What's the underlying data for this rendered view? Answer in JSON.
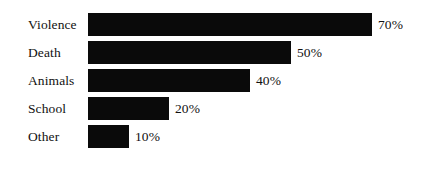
{
  "chart_data": {
    "type": "bar",
    "orientation": "horizontal",
    "title": "",
    "subtitle": "",
    "xlabel": "",
    "ylabel": "",
    "categories": [
      "Violence",
      "Death",
      "Animals",
      "School",
      "Other"
    ],
    "values": [
      70,
      50,
      40,
      20,
      10
    ],
    "value_labels": [
      "70%",
      "50%",
      "40%",
      "20%",
      "10%"
    ],
    "unit": "%",
    "xlim": [
      0,
      100
    ],
    "grid": false,
    "legend": false,
    "axis_lines": false,
    "tick_labels": [],
    "bar_color": "#0a0a0a",
    "background_color": "#ffffff",
    "text_color": "#111111",
    "series": [
      {
        "name": "",
        "values": [
          70,
          50,
          40,
          20,
          10
        ]
      }
    ],
    "bars": [
      {
        "category": "Violence",
        "value": 70,
        "label": "70%"
      },
      {
        "category": "Death",
        "value": 50,
        "label": "50%"
      },
      {
        "category": "Animals",
        "value": 40,
        "label": "40%"
      },
      {
        "category": "School",
        "value": 20,
        "label": "20%"
      },
      {
        "category": "Other",
        "value": 10,
        "label": "10%"
      }
    ]
  },
  "layout": {
    "row_top": [
      13,
      41,
      69,
      97,
      125
    ],
    "bar_left_px": 88,
    "px_per_unit": 4.05,
    "value_gap_px": 6
  }
}
